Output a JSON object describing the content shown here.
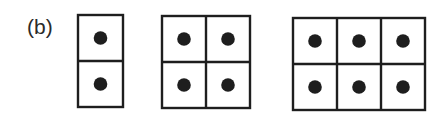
{
  "figure": {
    "panel_label": "(b)",
    "line_color": "#1e1e1e",
    "dot_color": "#1e1e1e",
    "grids": [
      {
        "name": "grid-1x2",
        "rows": 2,
        "cols": 1,
        "dots": 2
      },
      {
        "name": "grid-2x2",
        "rows": 2,
        "cols": 2,
        "dots": 4
      },
      {
        "name": "grid-3x2",
        "rows": 2,
        "cols": 3,
        "dots": 6
      }
    ]
  }
}
